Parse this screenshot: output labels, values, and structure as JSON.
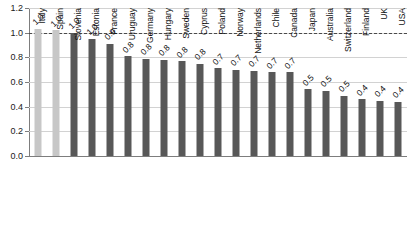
{
  "chart_data": {
    "type": "bar",
    "title": "",
    "subtitle": "",
    "xlabel": "",
    "ylabel": "",
    "ylim": [
      0.0,
      1.2
    ],
    "ytick_labels": [
      "0.0",
      "0.2",
      "0.4",
      "0.6",
      "0.8",
      "1.0",
      "1.2"
    ],
    "ytick_values": [
      0.0,
      0.2,
      0.4,
      0.6,
      0.8,
      1.0,
      1.2
    ],
    "grid": true,
    "legend": "none",
    "categories": [
      "Italy",
      "Spain",
      "Slovenia",
      "Estonia",
      "France",
      "Uruguay",
      "Germany",
      "Hungary",
      "Sweden",
      "Cyprus",
      "Poland",
      "Norway",
      "Netherlands",
      "Chile",
      "Canada",
      "Japan",
      "Australia",
      "Switzerland",
      "Finland",
      "UK",
      "USA"
    ],
    "values": [
      1.03,
      1.02,
      1.0,
      0.95,
      0.91,
      0.81,
      0.79,
      0.78,
      0.77,
      0.75,
      0.71,
      0.7,
      0.69,
      0.68,
      0.68,
      0.54,
      0.53,
      0.49,
      0.46,
      0.45,
      0.44
    ],
    "data_labels": [
      "1.0",
      "1.0",
      "1.0",
      "1.0",
      "0.9",
      "0.8",
      "0.8",
      "0.8",
      "0.8",
      "0.8",
      "0.7",
      "0.7",
      "0.7",
      "0.7",
      "0.7",
      "0.5",
      "0.5",
      "0.5",
      "0.4",
      "0.4",
      "0.4"
    ],
    "bar_styles": [
      "light",
      "light",
      "dark",
      "dark",
      "dark",
      "dark",
      "dark",
      "dark",
      "dark",
      "dark",
      "dark",
      "dark",
      "dark",
      "dark",
      "dark",
      "dark",
      "dark",
      "dark",
      "dark",
      "dark",
      "dark"
    ],
    "reference_line": {
      "value": 1.0,
      "style": "dashed",
      "color": "#4a4a4a"
    },
    "colors": {
      "bar_light": "#c7c7c7",
      "bar_dark": "#585858",
      "grid": "#d2d2d2",
      "axis": "#7d7d7d",
      "text": "#111111"
    }
  }
}
